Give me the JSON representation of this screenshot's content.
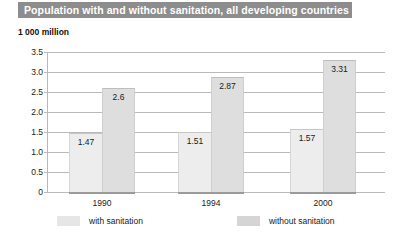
{
  "chart_data": {
    "type": "bar",
    "title": "Population with and without sanitation, all developing countries",
    "subtitle": "1 000 million",
    "xlabel": "",
    "ylabel": "1 000 million",
    "categories": [
      "1990",
      "1994",
      "2000"
    ],
    "series": [
      {
        "name": "with sanitation",
        "values": [
          1.47,
          1.51,
          1.57
        ],
        "color": "#ededed"
      },
      {
        "name": "without sanitation",
        "values": [
          2.6,
          2.87,
          3.31
        ],
        "color": "#dedede"
      }
    ],
    "value_labels": {
      "with": [
        "1.47",
        "1.51",
        "1.57"
      ],
      "without": [
        "2.6",
        "2.87",
        "3.31"
      ]
    },
    "ylim": [
      0,
      3.5
    ],
    "yticks": [
      3.5,
      3.0,
      2.5,
      2.0,
      1.5,
      1.0,
      0.5,
      0
    ],
    "ytick_labels": [
      "3.5",
      "3.0",
      "2.5",
      "2.0",
      "1.5",
      "1.0",
      "0.5",
      "0"
    ],
    "grid": true,
    "legend_position": "bottom"
  },
  "header": {
    "title": "Population with and without sanitation, all developing countries",
    "band_color": "#8d8d8d"
  },
  "axis": {
    "unit_caption": "1 000 million",
    "y_labels": [
      "3.5",
      "3.0",
      "2.5",
      "2.0",
      "1.5",
      "1.0",
      "0.5",
      "0"
    ],
    "x_labels": [
      "1990",
      "1994",
      "2000"
    ]
  },
  "groups": [
    {
      "label": "1990",
      "with_value": "1.47",
      "without_value": "2.6"
    },
    {
      "label": "1994",
      "with_value": "1.51",
      "without_value": "2.87"
    },
    {
      "label": "2000",
      "with_value": "1.57",
      "without_value": "3.31"
    }
  ],
  "legend": {
    "items": [
      {
        "label": "with sanitation",
        "color": "#e6e6e6"
      },
      {
        "label": "without sanitation",
        "color": "#d5d5d5"
      }
    ]
  }
}
